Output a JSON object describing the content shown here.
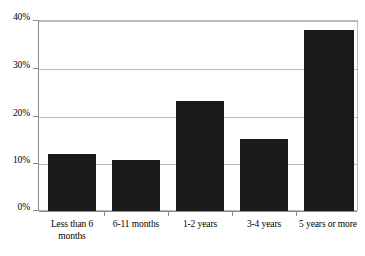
{
  "chart_data": {
    "type": "bar",
    "title": "",
    "subtitle": "",
    "xlabel": "",
    "ylabel": "",
    "categories": [
      "Less than 6 months",
      "6-11 months",
      "1-2 years",
      "3-4 years",
      "5 years or more"
    ],
    "values": [
      12.0,
      10.7,
      23.1,
      15.2,
      38.1
    ],
    "value_labels": [
      "12%",
      "10.7%",
      "23.1%",
      "15.2%",
      "38.1%"
    ],
    "ylim": [
      0,
      40
    ],
    "yticks": [
      0,
      10,
      20,
      30,
      40
    ],
    "ytick_labels": [
      "0%",
      "10%",
      "20%",
      "30%",
      "40%"
    ],
    "grid": true,
    "grid_axis": "y",
    "legend": false,
    "legend_position": "none",
    "bar_color": "#1a1a1a",
    "grid_color": "#b9b9b9",
    "axis_color": "#8a8a8a",
    "background_color": "#ffffff"
  }
}
